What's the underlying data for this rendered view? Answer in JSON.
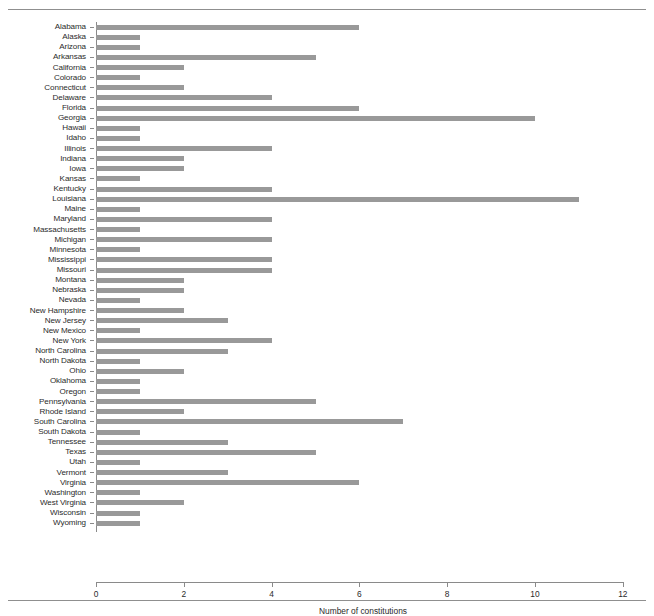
{
  "figure": {
    "has_top_rule": true,
    "has_bottom_rule": true,
    "bar_color": "#999999",
    "axis_color": "#8a8a8a",
    "text_color": "#2b2b2b"
  },
  "axis": {
    "x_title": "Number of constitutions",
    "x_ticks": [
      "0",
      "2",
      "4",
      "6",
      "8",
      "10",
      "12"
    ]
  },
  "chart_data": {
    "type": "bar",
    "orientation": "horizontal",
    "title": "",
    "xlabel": "Number of constitutions",
    "ylabel": "",
    "xlim": [
      0,
      12
    ],
    "xticks": [
      0,
      2,
      4,
      6,
      8,
      10,
      12
    ],
    "grid": false,
    "legend": false,
    "bar_color": "#999999",
    "categories": [
      "Alabama",
      "Alaska",
      "Arizona",
      "Arkansas",
      "California",
      "Colorado",
      "Connecticut",
      "Delaware",
      "Florida",
      "Georgia",
      "Hawaii",
      "Idaho",
      "Illinois",
      "Indiana",
      "Iowa",
      "Kansas",
      "Kentucky",
      "Louisiana",
      "Maine",
      "Maryland",
      "Massachusetts",
      "Michigan",
      "Minnesota",
      "Mississippi",
      "Missouri",
      "Montana",
      "Nebraska",
      "Nevada",
      "New Hampshire",
      "New Jersey",
      "New Mexico",
      "New York",
      "North Carolina",
      "North Dakota",
      "Ohio",
      "Oklahoma",
      "Oregon",
      "Pennsylvania",
      "Rhode Island",
      "South Carolina",
      "South Dakota",
      "Tennessee",
      "Texas",
      "Utah",
      "Vermont",
      "Virginia",
      "Washington",
      "West Virginia",
      "Wisconsin",
      "Wyoming"
    ],
    "values": [
      6,
      1,
      1,
      5,
      2,
      1,
      2,
      4,
      6,
      10,
      1,
      1,
      4,
      2,
      2,
      1,
      4,
      11,
      1,
      4,
      1,
      4,
      1,
      4,
      4,
      2,
      2,
      1,
      2,
      3,
      1,
      4,
      3,
      1,
      2,
      1,
      1,
      5,
      2,
      7,
      1,
      3,
      5,
      1,
      3,
      6,
      1,
      2,
      1,
      1
    ]
  }
}
